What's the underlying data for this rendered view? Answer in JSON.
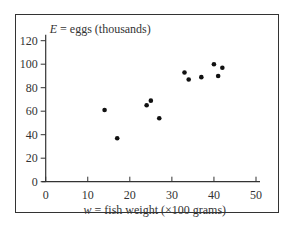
{
  "chart_data": {
    "type": "scatter",
    "title": "",
    "ylabel_var": "E",
    "ylabel_text": " = eggs (thousands)",
    "xlabel_var": "w",
    "xlabel_text": " = fish weight (×100 grams)",
    "xlim": [
      0,
      50
    ],
    "ylim": [
      0,
      120
    ],
    "xticks": [
      0,
      10,
      20,
      30,
      40,
      50
    ],
    "yticks": [
      0,
      20,
      40,
      60,
      80,
      100,
      120
    ],
    "grid": false,
    "legend": null,
    "points": [
      {
        "x": 14,
        "y": 61
      },
      {
        "x": 17,
        "y": 37
      },
      {
        "x": 24,
        "y": 65
      },
      {
        "x": 25,
        "y": 69
      },
      {
        "x": 27,
        "y": 54
      },
      {
        "x": 33,
        "y": 93
      },
      {
        "x": 34,
        "y": 87
      },
      {
        "x": 37,
        "y": 89
      },
      {
        "x": 40,
        "y": 100
      },
      {
        "x": 41,
        "y": 90
      },
      {
        "x": 42,
        "y": 97
      }
    ]
  }
}
